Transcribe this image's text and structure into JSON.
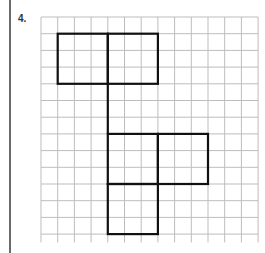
{
  "problem": {
    "number_label": "4."
  },
  "grid": {
    "origin_x": 41,
    "origin_y": 17,
    "cell_size": 16.7,
    "columns": 13,
    "rows": 13.5,
    "line_color": "#bdbdbd",
    "shape_color": "#111111"
  },
  "shapes": [
    {
      "name": "square-top-left",
      "col": 1,
      "row": 1,
      "size": 3
    },
    {
      "name": "square-top-right",
      "col": 4,
      "row": 1,
      "size": 3
    },
    {
      "name": "square-middle-left",
      "col": 4,
      "row": 7,
      "size": 3
    },
    {
      "name": "square-middle-right",
      "col": 7,
      "row": 7,
      "size": 3
    },
    {
      "name": "square-bottom",
      "col": 4,
      "row": 10,
      "size": 3
    }
  ],
  "connector": {
    "col": 4,
    "row_start": 4,
    "row_end": 7
  }
}
